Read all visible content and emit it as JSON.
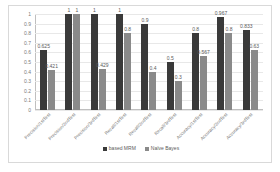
{
  "chart_data": {
    "type": "bar",
    "title": "",
    "xlabel": "",
    "ylabel": "",
    "ylim": [
      0,
      1
    ],
    "grid": true,
    "legend_position": "bottom",
    "yticks": [
      "1",
      "0.9",
      "0.8",
      "0.7",
      "0.6",
      "0.5",
      "0.4",
      "0.3",
      "0.2",
      "0.1",
      "0"
    ],
    "categories": [
      "Precision/1stTest",
      "Precision/2ndTest",
      "Precision/3rdTest",
      "Recall/1stTest",
      "Recall/2ndTest",
      "Recall/3rdTest",
      "Accuracy/1stTest",
      "Accuracy/2ndTest",
      "Accuracy/3rdTest"
    ],
    "series": [
      {
        "name": "based MRM",
        "color": "#3a3a3a",
        "values": [
          0.625,
          1,
          1,
          1,
          0.9,
          0.5,
          0.8,
          0.967,
          0.833
        ],
        "labels": [
          "0.625",
          "1",
          "1",
          "1",
          "0.9",
          "0.5",
          "0.8",
          "0.967",
          "0.833"
        ]
      },
      {
        "name": "Naïve Bayes",
        "color": "#8a8a8a",
        "values": [
          0.421,
          1,
          0.429,
          0.8,
          0.4,
          0.3,
          0.567,
          0.8,
          0.63
        ],
        "labels": [
          "0.421",
          "1",
          "0.429",
          "0.8",
          "0.4",
          "0.3",
          "0.567",
          "0.8",
          "0.63"
        ]
      }
    ]
  }
}
